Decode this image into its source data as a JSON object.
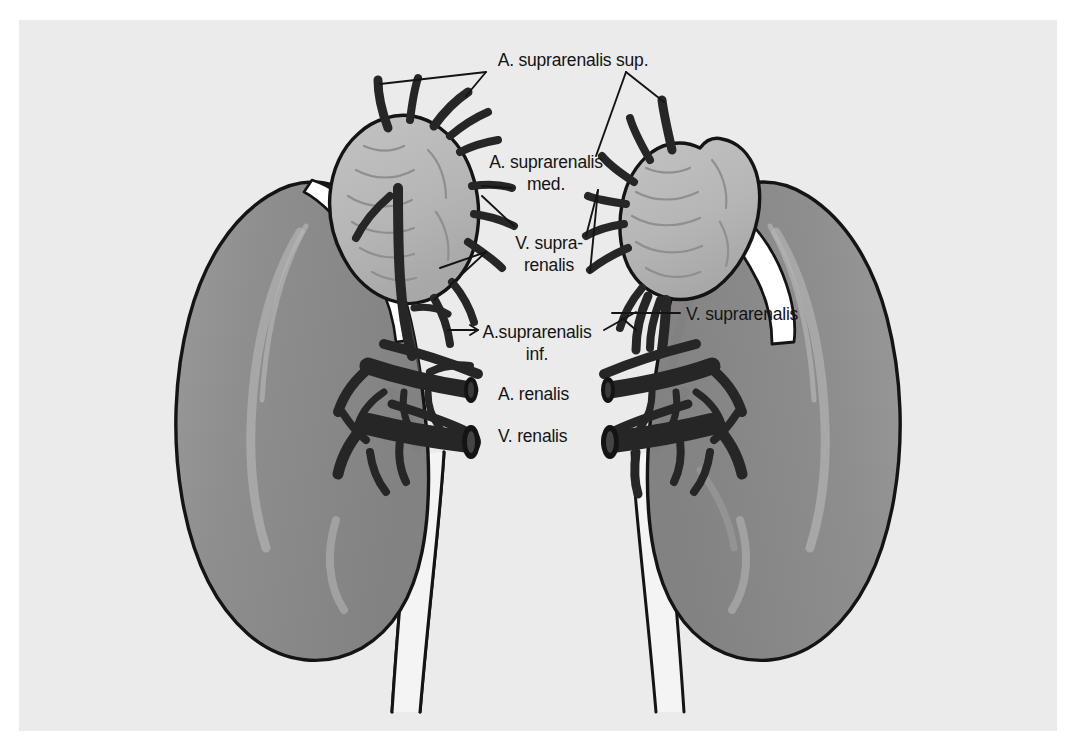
{
  "figure": {
    "type": "anatomical-illustration",
    "style": "grayscale line drawing",
    "background_color": "#ebebeb",
    "page_color": "#ffffff",
    "outline_color": "#141414",
    "kidney_color": "#8e8e8e",
    "kidney_shadow_color": "#7c7c7c",
    "kidney_highlight_color": "#a9a9a9",
    "adrenal_color": "#b9b9b9",
    "adrenal_shadow_color": "#a6a6a6",
    "vessel_color": "#262626",
    "ureter_color": "#f3f3f3",
    "white_fat_color": "#ffffff",
    "frame": {
      "left": 19,
      "top": 20,
      "width": 1038,
      "height": 711
    }
  },
  "labels": {
    "suprarenalis_sup": {
      "text": "A. suprarenalis sup.",
      "x": 573,
      "y": 60,
      "anchor": "middle",
      "lines": [
        "A. suprarenalis sup."
      ]
    },
    "suprarenalis_med": {
      "text": "A. suprarenalis med.",
      "x": 546,
      "y": 162,
      "anchor": "middle",
      "lines": [
        "A. suprarenalis",
        "med."
      ]
    },
    "vena_suprarenalis_left": {
      "text": "V. supra-renalis",
      "x": 555,
      "y": 243,
      "anchor": "middle",
      "lines": [
        "V. supra-",
        "renalis"
      ]
    },
    "suprarenalis_inf": {
      "text": "A. suprarenalis inf.",
      "x": 537,
      "y": 334,
      "anchor": "middle",
      "lines": [
        "A.suprarenalis",
        "inf."
      ]
    },
    "vena_suprarenalis_right": {
      "text": "V. suprarenalis",
      "x": 686,
      "y": 317,
      "anchor": "start",
      "lines": [
        "V. suprarenalis"
      ]
    },
    "arteria_renalis": {
      "text": "A. renalis",
      "x": 508,
      "y": 399,
      "anchor": "start",
      "lines": [
        "A. renalis"
      ]
    },
    "vena_renalis": {
      "text": "V. renalis",
      "x": 508,
      "y": 441,
      "anchor": "start",
      "lines": [
        "V. renalis"
      ]
    }
  },
  "structures": {
    "kidney_left": "left kidney",
    "kidney_right": "right kidney",
    "adrenal_left": "left suprarenal gland",
    "adrenal_right": "right suprarenal gland",
    "ureter_left": "left ureter",
    "ureter_right": "right ureter"
  }
}
